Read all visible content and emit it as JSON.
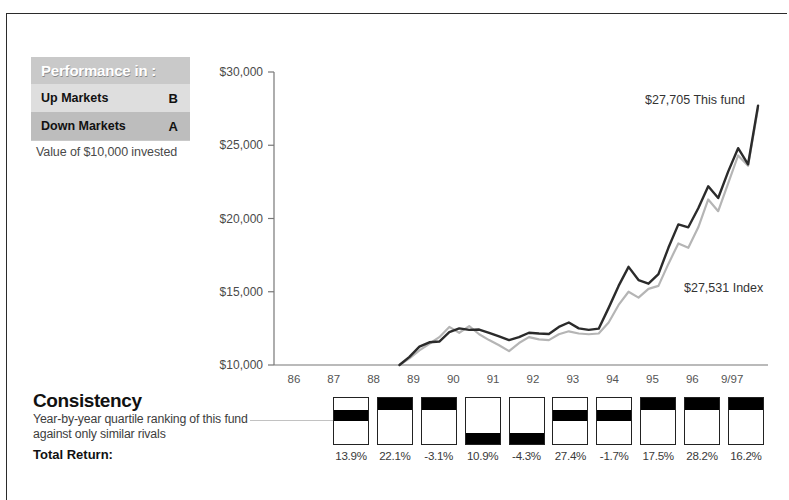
{
  "performance_box": {
    "title": "Performance in :",
    "rows": [
      {
        "label": "Up Markets",
        "grade": "B"
      },
      {
        "label": "Down Markets",
        "grade": "A"
      }
    ],
    "caption": "Value of $10,000 invested"
  },
  "consistency": {
    "title": "Consistency",
    "subtitle_line1": "Year-by-year quartile ranking of this",
    "subtitle_line2": "fund against only similar rivals",
    "total_return_label": "Total Return:"
  },
  "chart_data": {
    "type": "line",
    "title": "Value of $10,000 invested",
    "xlabel": "",
    "ylabel": "",
    "ylim": [
      10000,
      30000
    ],
    "yticks": [
      10000,
      15000,
      20000,
      25000,
      30000
    ],
    "ytick_labels": [
      "$10,000",
      "$15,000",
      "$20,000",
      "$25,000",
      "$30,000"
    ],
    "grid": false,
    "legend_position": "inline-annotation",
    "categories": [
      "86",
      "87",
      "88",
      "89",
      "90",
      "91",
      "92",
      "93",
      "94",
      "95",
      "96",
      "9/97"
    ],
    "annotations": [
      {
        "text": "$27,705 This fund",
        "value": 27705,
        "series": "This fund"
      },
      {
        "text": "$27,531 Index",
        "value": 27531,
        "series": "Index"
      }
    ],
    "series": [
      {
        "name": "This fund",
        "color": "#2b2b2b",
        "final_value": 27705,
        "x": [
          88.65,
          88.9,
          89.15,
          89.4,
          89.65,
          89.9,
          90.15,
          90.4,
          90.65,
          90.9,
          91.15,
          91.4,
          91.65,
          91.9,
          92.15,
          92.4,
          92.65,
          92.9,
          93.15,
          93.4,
          93.65,
          93.9,
          94.15,
          94.4,
          94.65,
          94.9,
          95.15,
          95.4,
          95.65,
          95.9,
          96.15,
          96.4,
          96.65,
          96.9,
          97.15,
          97.4,
          97.65
        ],
        "values": [
          10000,
          10550,
          11250,
          11550,
          11600,
          12250,
          12500,
          12400,
          12420,
          12200,
          11950,
          11700,
          11900,
          12200,
          12150,
          12120,
          12600,
          12900,
          12500,
          12400,
          12480,
          13900,
          15400,
          16700,
          15800,
          15550,
          16200,
          18000,
          19600,
          19400,
          20700,
          22200,
          21400,
          23200,
          24800,
          23700,
          27705
        ]
      },
      {
        "name": "Index",
        "color": "#b5b5b5",
        "final_value": 27531,
        "x": [
          88.65,
          88.9,
          89.15,
          89.4,
          89.65,
          89.9,
          90.15,
          90.4,
          90.65,
          90.9,
          91.15,
          91.4,
          91.65,
          91.9,
          92.15,
          92.4,
          92.65,
          92.9,
          93.15,
          93.4,
          93.65,
          93.9,
          94.15,
          94.4,
          94.65,
          94.9,
          95.15,
          95.4,
          95.65,
          95.9,
          96.15,
          96.4,
          96.65,
          96.9,
          97.15,
          97.4,
          97.65
        ],
        "values": [
          10000,
          10450,
          11000,
          11450,
          11900,
          12600,
          12200,
          12650,
          12100,
          11700,
          11350,
          10950,
          11500,
          11900,
          11750,
          11700,
          12100,
          12300,
          12150,
          12100,
          12150,
          12900,
          14100,
          15000,
          14600,
          15200,
          15400,
          16900,
          18300,
          18000,
          19400,
          21300,
          20500,
          22400,
          24300,
          23600,
          27531
        ]
      }
    ]
  },
  "quartiles": {
    "years": [
      "88",
      "89",
      "90",
      "91",
      "92",
      "93",
      "94",
      "95",
      "96",
      "9/97"
    ],
    "rank": [
      2,
      1,
      1,
      4,
      4,
      2,
      2,
      1,
      1,
      1
    ],
    "returns": [
      "13.9%",
      "22.1%",
      "-3.1%",
      "10.9%",
      "-4.3%",
      "27.4%",
      "-1.7%",
      "17.5%",
      "28.2%",
      "16.2%"
    ]
  },
  "colors": {
    "fund_line": "#2b2b2b",
    "index_line": "#b5b5b5",
    "axis": "#777777",
    "header_bg": "#c9c9c9"
  }
}
